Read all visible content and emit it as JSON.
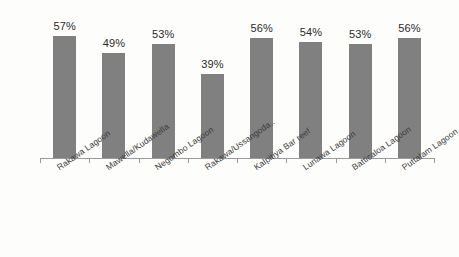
{
  "chart_data": {
    "type": "bar",
    "title": "",
    "subtitle": "",
    "xlabel": "",
    "ylabel": "",
    "ylim": [
      0,
      70
    ],
    "grid": false,
    "legend": false,
    "bar_color": "#808080",
    "value_suffix": "%",
    "categories": [
      "Rakawa Lagoon",
      "Mawella/Kudawella",
      "Negombo Lagoon",
      "Rakawa/Ussangoda..",
      "Kalpitiya Bar reef",
      "Lunawa Lagoon",
      "Batticaloa Lagoon",
      "Puttalam Lagoon"
    ],
    "values": [
      57,
      49,
      53,
      39,
      56,
      54,
      53,
      56
    ],
    "value_labels": [
      "57%",
      "49%",
      "53%",
      "39%",
      "56%",
      "54%",
      "53%",
      "56%"
    ]
  },
  "axis": {
    "line_color": "#9a9a9a",
    "tick_count": 9
  }
}
